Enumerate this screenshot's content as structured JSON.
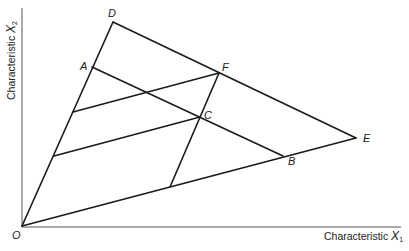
{
  "axes": {
    "x_label": "Characteristic ",
    "x_var": "X",
    "x_sub": "1",
    "y_label": "Characteristic ",
    "y_var": "X",
    "y_sub": "2",
    "origin_label": "O"
  },
  "points": {
    "O": {
      "label": "O",
      "x": 22,
      "y": 226
    },
    "D": {
      "label": "D",
      "x": 113,
      "y": 22
    },
    "A": {
      "label": "A",
      "x": 92,
      "y": 67
    },
    "F": {
      "label": "F",
      "x": 219,
      "y": 73
    },
    "C": {
      "label": "C",
      "x": 200,
      "y": 117
    },
    "E": {
      "label": "E",
      "x": 356,
      "y": 138
    },
    "B": {
      "label": "B",
      "x": 283,
      "y": 156
    }
  },
  "segments": [
    {
      "name": "ray-OD",
      "from": "O",
      "to": "D"
    },
    {
      "name": "ray-OE",
      "from": "O",
      "to": "E"
    },
    {
      "name": "frontier-DE",
      "from": "D",
      "to": "E"
    },
    {
      "name": "line-AB",
      "from": "A",
      "to": "B"
    },
    {
      "name": "line-FC-extended",
      "from": "F",
      "to": "OE-point"
    },
    {
      "name": "line-upper-to-F",
      "from": "OD-upper",
      "to": "F"
    },
    {
      "name": "line-lower-to-C",
      "from": "OD-lower",
      "to": "C"
    }
  ]
}
